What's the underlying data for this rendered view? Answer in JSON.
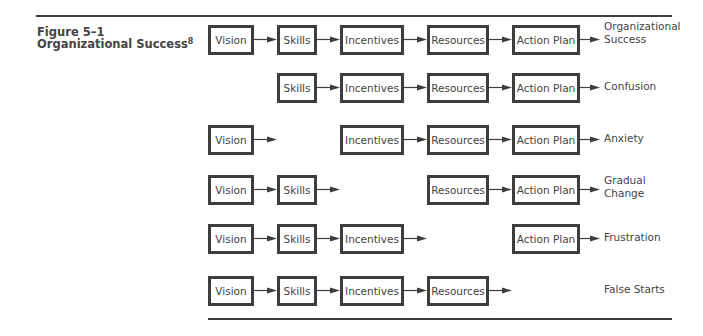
{
  "figure": {
    "label": "Figure 5–1",
    "title": "Organizational Success",
    "footnote_marker": "8"
  },
  "columns": [
    "Vision",
    "Skills",
    "Incentives",
    "Resources",
    "Action Plan"
  ],
  "rows": [
    {
      "elements": [
        "Vision",
        "Skills",
        "Incentives",
        "Resources",
        "Action Plan"
      ],
      "outcome": [
        "Organizational",
        "Success"
      ]
    },
    {
      "elements": [
        "Skills",
        "Incentives",
        "Resources",
        "Action Plan"
      ],
      "missing": "Vision",
      "outcome": [
        "Confusion"
      ]
    },
    {
      "elements": [
        "Vision",
        "Incentives",
        "Resources",
        "Action Plan"
      ],
      "missing": "Skills",
      "outcome": [
        "Anxiety"
      ]
    },
    {
      "elements": [
        "Vision",
        "Skills",
        "Resources",
        "Action Plan"
      ],
      "missing": "Incentives",
      "outcome": [
        "Gradual",
        "Change"
      ]
    },
    {
      "elements": [
        "Vision",
        "Skills",
        "Incentives",
        "Action Plan"
      ],
      "missing": "Resources",
      "outcome": [
        "Frustration"
      ]
    },
    {
      "elements": [
        "Vision",
        "Skills",
        "Incentives",
        "Resources"
      ],
      "missing": "Action Plan",
      "outcome": [
        "False Starts"
      ]
    }
  ],
  "labels": {
    "r0": {
      "c0": "Vision",
      "c1": "Skills",
      "c2": "Incentives",
      "c3": "Resources",
      "c4": "Action Plan",
      "o1": "Organizational",
      "o2": "Success"
    },
    "r1": {
      "c1": "Skills",
      "c2": "Incentives",
      "c3": "Resources",
      "c4": "Action Plan",
      "o1": "Confusion"
    },
    "r2": {
      "c0": "Vision",
      "c2": "Incentives",
      "c3": "Resources",
      "c4": "Action Plan",
      "o1": "Anxiety"
    },
    "r3": {
      "c0": "Vision",
      "c1": "Skills",
      "c3": "Resources",
      "c4": "Action Plan",
      "o1": "Gradual",
      "o2": "Change"
    },
    "r4": {
      "c0": "Vision",
      "c1": "Skills",
      "c2": "Incentives",
      "c4": "Action Plan",
      "o1": "Frustration"
    },
    "r5": {
      "c0": "Vision",
      "c1": "Skills",
      "c2": "Incentives",
      "c3": "Resources",
      "o1": "False Starts"
    }
  },
  "colors": {
    "line": "#3d3d3d",
    "text": "#444444",
    "background": "#ffffff"
  }
}
